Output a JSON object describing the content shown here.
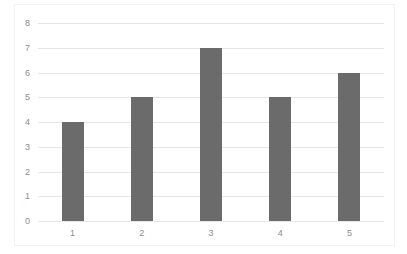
{
  "chart_data": {
    "type": "bar",
    "title": "",
    "xlabel": "",
    "ylabel": "",
    "categories": [
      "1",
      "2",
      "3",
      "4",
      "5"
    ],
    "values": [
      4,
      5,
      7,
      5,
      6
    ],
    "ylim": [
      0,
      8
    ],
    "yticks": [
      "0",
      "1",
      "2",
      "3",
      "4",
      "5",
      "6",
      "7",
      "8"
    ],
    "grid": true,
    "legend": null,
    "bar_color": "#6b6b6b",
    "gridline_color": "#e6e6e6"
  }
}
